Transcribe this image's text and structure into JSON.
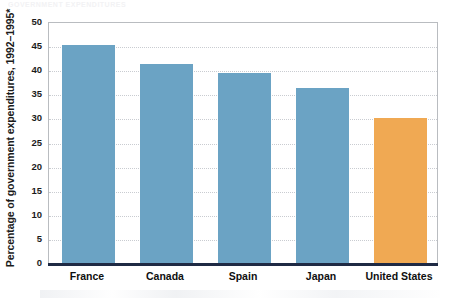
{
  "figure": {
    "cut_off_header": "GOVERNMENT EXPENDITURES",
    "axis_note_symbol": "*"
  },
  "chart_data": {
    "type": "bar",
    "title": "",
    "subtitle": "",
    "xlabel": "",
    "ylabel": "Percentage of government expenditures, 1992–1995*",
    "categories": [
      "France",
      "Canada",
      "Spain",
      "Japan",
      "United States"
    ],
    "values": [
      45.2,
      41.2,
      39.4,
      36.3,
      30.0
    ],
    "ylim": [
      0,
      50
    ],
    "yticks": [
      0,
      5,
      10,
      15,
      20,
      25,
      30,
      35,
      40,
      45,
      50
    ],
    "ytick_labels": [
      "0",
      "5",
      "10",
      "15",
      "20",
      "25",
      "30",
      "35",
      "40",
      "45",
      "50"
    ],
    "grid": true,
    "grid_axis": "y",
    "legend": "none",
    "bar_colors": [
      "#6ba3c4",
      "#6ba3c4",
      "#6ba3c4",
      "#6ba3c4",
      "#f0a953"
    ],
    "highlight_category": "United States",
    "colors": {
      "bar_blue": "#6ba3c4",
      "bar_orange": "#f0a953",
      "axis_line": "#1f2a44",
      "plot_border": "#b9bcc0",
      "gridline": "#c9ccd1",
      "text": "#1b1b1b",
      "background": "#ffffff"
    }
  }
}
